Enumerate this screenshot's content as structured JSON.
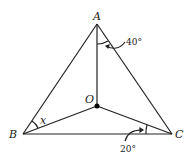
{
  "diagram": {
    "points": {
      "A": {
        "label": "A",
        "x": 97,
        "y": 24
      },
      "B": {
        "label": "B",
        "x": 23,
        "y": 134
      },
      "C": {
        "label": "C",
        "x": 172,
        "y": 134
      },
      "O": {
        "label": "O",
        "x": 97,
        "y": 106
      }
    },
    "segments": [
      "AB",
      "AC",
      "BC",
      "AO",
      "BO",
      "CO"
    ],
    "angles": {
      "OAC": {
        "label": "40°"
      },
      "OCB": {
        "label": "20°"
      },
      "ABO": {
        "label": "x"
      }
    },
    "line_color": "#222222"
  }
}
